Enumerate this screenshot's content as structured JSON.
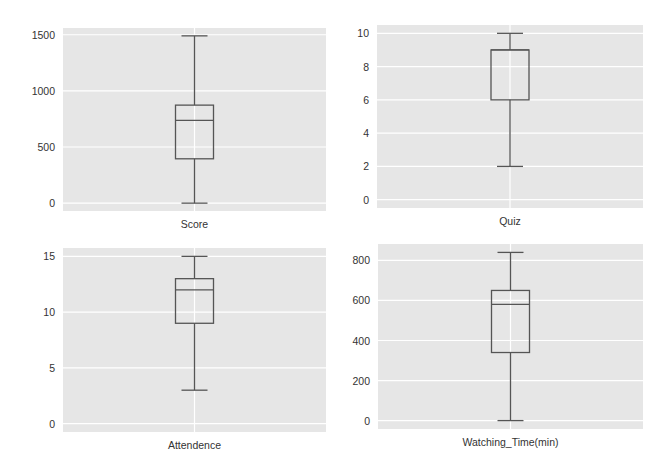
{
  "figure": {
    "background": "#ffffff",
    "plot_background": "#e6e6e6",
    "grid_color": "#ffffff",
    "box_color": "#555555",
    "text_color": "#333333"
  },
  "chart_data": [
    {
      "type": "box",
      "title": "",
      "xlabel": "Score",
      "ylabel": "",
      "categories": [
        "Score"
      ],
      "yticks": [
        0,
        500,
        1000,
        1500
      ],
      "ylim": [
        -70,
        1560
      ],
      "grid": true,
      "box": {
        "whisker_low": 0,
        "q1": 395,
        "median": 738,
        "q3": 873,
        "whisker_high": 1490
      },
      "layout": {
        "x": 63,
        "y": 28,
        "w": 263,
        "h": 183
      }
    },
    {
      "type": "box",
      "title": "",
      "xlabel": "Quiz",
      "ylabel": "",
      "categories": [
        "Quiz"
      ],
      "yticks": [
        0,
        2,
        4,
        6,
        8,
        10
      ],
      "ylim": [
        -0.5,
        10.5
      ],
      "grid": true,
      "box": {
        "whisker_low": 2,
        "q1": 6,
        "median": 9,
        "q3": 9,
        "whisker_high": 10
      },
      "layout": {
        "x": 377,
        "y": 25,
        "w": 266,
        "h": 183
      }
    },
    {
      "type": "box",
      "title": "",
      "xlabel": "Attendence",
      "ylabel": "",
      "categories": [
        "Attendence"
      ],
      "yticks": [
        0,
        5,
        10,
        15
      ],
      "ylim": [
        -0.75,
        15.75
      ],
      "grid": true,
      "box": {
        "whisker_low": 3,
        "q1": 9,
        "median": 12,
        "q3": 13,
        "whisker_high": 15
      },
      "layout": {
        "x": 63,
        "y": 248,
        "w": 263,
        "h": 184
      }
    },
    {
      "type": "box",
      "title": "",
      "xlabel": "Watching_Time(min)",
      "ylabel": "",
      "categories": [
        "Watching_Time(min)"
      ],
      "yticks": [
        0,
        200,
        400,
        600,
        800
      ],
      "ylim": [
        -42,
        882
      ],
      "grid": true,
      "box": {
        "whisker_low": 0,
        "q1": 340,
        "median": 580,
        "q3": 650,
        "whisker_high": 840
      },
      "layout": {
        "x": 378,
        "y": 244,
        "w": 265,
        "h": 185
      }
    }
  ]
}
